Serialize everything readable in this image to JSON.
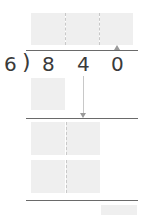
{
  "problem": {
    "divisor": "6",
    "bracket": ")",
    "dividend_digits": [
      "8",
      "4",
      "0"
    ]
  },
  "colors": {
    "box_fill": "#efefef",
    "line": "#6a6a6a",
    "digit": "#3a3a3a"
  }
}
